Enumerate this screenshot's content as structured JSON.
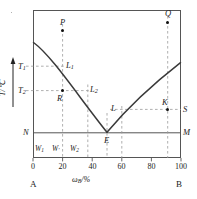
{
  "figure": {
    "kind": "binary-eutectic-phase-diagram",
    "axes": {
      "y_caption": "T/℃",
      "x_caption_main": "ω",
      "x_caption_sub": "B",
      "x_caption_tail": "/%",
      "x_ticks": [
        "0",
        "20",
        "40",
        "60",
        "80",
        "100"
      ],
      "x_tick_values": [
        0,
        20,
        40,
        60,
        80,
        100
      ],
      "x_range": [
        0,
        100
      ],
      "left_end_label": "A",
      "right_end_label": "B",
      "y_tick_labels": [
        {
          "base": "T",
          "sub": "1"
        },
        {
          "base": "T",
          "sub": "2"
        }
      ]
    },
    "points": [
      {
        "name": "P",
        "base": "P",
        "sub": "",
        "x": 20,
        "t": 0.895,
        "dot": true
      },
      {
        "name": "Q",
        "base": "Q",
        "sub": "",
        "x": 91,
        "t": 0.955,
        "dot": true
      },
      {
        "name": "L1",
        "base": "L",
        "sub": "1",
        "x": 20,
        "t": 0.62,
        "dot": false
      },
      {
        "name": "L2",
        "base": "L",
        "sub": "2",
        "x": 37,
        "t": 0.455,
        "dot": false
      },
      {
        "name": "L",
        "base": "L",
        "sub": "",
        "x": 60,
        "t": 0.33,
        "dot": false
      },
      {
        "name": "R",
        "base": "R",
        "sub": "",
        "x": 20,
        "t": 0.455,
        "dot": true
      },
      {
        "name": "K",
        "base": "K",
        "sub": "",
        "x": 91,
        "t": 0.33,
        "dot": true
      },
      {
        "name": "S",
        "base": "S",
        "sub": "",
        "x": 100,
        "t": 0.33,
        "dot": false
      },
      {
        "name": "N",
        "base": "N",
        "sub": "",
        "x": 0,
        "t": 0.17,
        "dot": false
      },
      {
        "name": "M",
        "base": "M",
        "sub": "",
        "x": 100,
        "t": 0.17,
        "dot": false
      },
      {
        "name": "E",
        "base": "E",
        "sub": "",
        "x": 50,
        "t": 0.17,
        "dot": false
      }
    ],
    "composition_markers": [
      {
        "base": "W",
        "sub": "1",
        "x": 6
      },
      {
        "base": "W",
        "sub": "′",
        "x": 20
      },
      {
        "base": "W",
        "sub": "2",
        "x": 33
      }
    ],
    "guide_verticals": [
      20,
      37,
      50,
      60,
      91
    ],
    "eutectic": {
      "x": 50,
      "t": 0.17
    },
    "curve": {
      "type": "liquidus-V",
      "left_branch_start": {
        "x": 0,
        "t": 0.78
      },
      "right_branch_end": {
        "x": 100,
        "t": 0.64
      }
    },
    "colors": {
      "frame": "#555555",
      "curve": "#3a3a3a",
      "dash": "#9a9a9a",
      "solid_line": "#555555",
      "text": "#1a1a1a"
    }
  }
}
